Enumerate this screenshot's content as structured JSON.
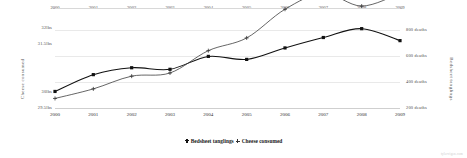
{
  "chart_data": {
    "type": "line",
    "title": "",
    "subtitle": "",
    "xlabel": "",
    "grid": true,
    "legend_position": "bottom",
    "x": [
      2000,
      2001,
      2002,
      2003,
      2004,
      2005,
      2006,
      2007,
      2008,
      2009
    ],
    "x_tick_labels_top": [
      "2000",
      "2001",
      "2002",
      "2003",
      "2004",
      "2005",
      "2006",
      "2007",
      "2008",
      "2009"
    ],
    "x_tick_labels_bottom": [
      "2000",
      "2001",
      "2002",
      "2003",
      "2004",
      "2005",
      "2006",
      "2007",
      "2008",
      "2009"
    ],
    "axes": [
      {
        "id": "left",
        "label": "Cheese consumed",
        "tick_labels": [
          "32lbs",
          "31.5lbs",
          "30lbs",
          "29.5lbs"
        ],
        "tick_values": [
          32,
          31.5,
          30,
          29.5
        ],
        "ylim": [
          29.5,
          32.2
        ]
      },
      {
        "id": "right",
        "label": "Bedsheet tanglings",
        "tick_labels": [
          "800 deaths",
          "600 deaths",
          "400 deaths",
          "200 deaths"
        ],
        "tick_values": [
          800,
          600,
          400,
          200
        ],
        "ylim": [
          200,
          860
        ]
      }
    ],
    "series": [
      {
        "name": "Bedsheet tanglings",
        "axis": "right",
        "unit": "deaths",
        "marker": "filled-square",
        "values": [
          327,
          456,
          509,
          497,
          596,
          573,
          661,
          741,
          809,
          717
        ]
      },
      {
        "name": "Cheese consumed",
        "axis": "left",
        "unit": "lbs",
        "marker": "plus",
        "values": [
          29.8,
          30.1,
          30.5,
          30.6,
          31.3,
          31.7,
          32.6,
          33.1,
          32.7,
          33.1
        ]
      }
    ],
    "legend": [
      {
        "label": "Bedsheet tanglings",
        "marker": "filled-square"
      },
      {
        "label": "Cheese consumed",
        "marker": "plus"
      }
    ],
    "colors": {
      "series_primary": "#111111",
      "series_secondary": "#333333",
      "grid": "#e9e9e9",
      "text": "#2b2b2b",
      "background": "#ffffff"
    }
  },
  "watermark": "tylervigen.com"
}
